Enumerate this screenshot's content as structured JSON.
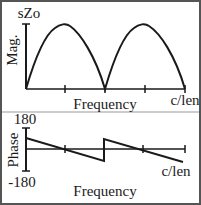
{
  "magnitude_plot": {
    "top_label": "sZo",
    "y_label": "Mag.",
    "x_label": "Frequency",
    "x_end_label": "c/len"
  },
  "phase_plot": {
    "y_max_label": "180",
    "y_min_label": "-180",
    "y_label": "Phase",
    "x_end_label": "c/len",
    "x_label": "Frequency"
  },
  "colors": {
    "line": "#1a1a1a",
    "border": "#555555"
  }
}
